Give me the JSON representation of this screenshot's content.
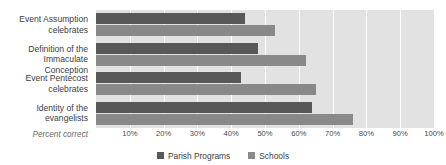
{
  "chart_data": {
    "type": "bar",
    "orientation": "horizontal",
    "title": "",
    "xlabel": "Percent correct",
    "ylabel": "",
    "categories": [
      "Event Assumption celebrates",
      "Definition of the Immaculate Conception",
      "Event Pentecost celebrates",
      "Identity of the evangelists"
    ],
    "category_lines": [
      [
        "Event Assumption",
        "celebrates"
      ],
      [
        "Definition of the",
        "Immaculate Conception"
      ],
      [
        "Event Pentecost",
        "celebrates"
      ],
      [
        "Identity of the",
        "evangelists"
      ]
    ],
    "series": [
      {
        "name": "Parish Programs",
        "color": "#585858",
        "values": [
          44,
          48,
          43,
          64
        ]
      },
      {
        "name": "Schools",
        "color": "#898989",
        "values": [
          53,
          62,
          65,
          76
        ]
      }
    ],
    "xlim": [
      0,
      100
    ],
    "xticks": [
      0,
      10,
      20,
      30,
      40,
      50,
      60,
      70,
      80,
      90,
      100
    ],
    "xtick_labels": [
      "",
      "10%",
      "20%",
      "30%",
      "40%",
      "50%",
      "60%",
      "70%",
      "80%",
      "90%",
      "100%"
    ],
    "grid": "vertical",
    "plot_background": "#e2e2e2",
    "gridline_color": "#ffffff",
    "legend_position": "bottom-center"
  },
  "axis": {
    "caption": "Percent correct"
  },
  "legend": {
    "items": [
      {
        "label": "Parish Programs",
        "color": "#585858"
      },
      {
        "label": "Schools",
        "color": "#898989"
      }
    ]
  }
}
